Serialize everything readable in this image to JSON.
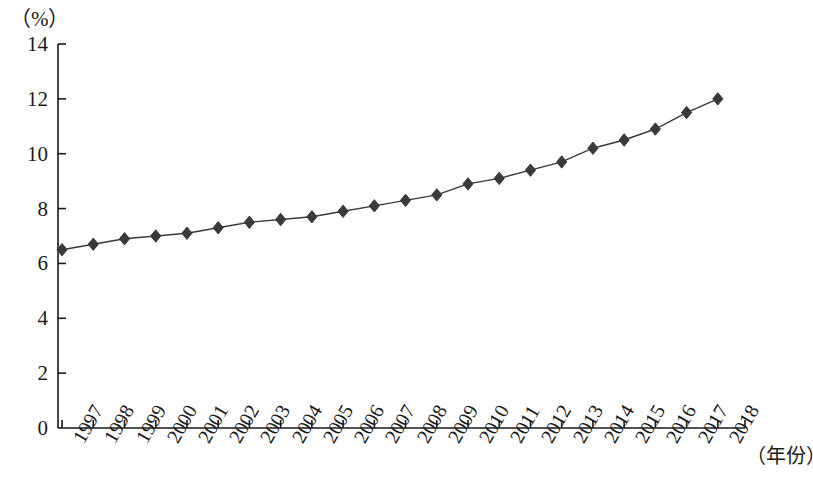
{
  "chart_data": {
    "type": "line",
    "title": "",
    "subtitle": "",
    "ylabel": "（%）",
    "xlabel": "（年份）",
    "ylim": [
      0,
      14
    ],
    "ytick_values": [
      0,
      2,
      4,
      6,
      8,
      10,
      12,
      14
    ],
    "ytick_labels": [
      "0",
      "2",
      "4",
      "6",
      "8",
      "10",
      "12",
      "14"
    ],
    "grid": false,
    "legend": null,
    "marker": "diamond",
    "line_color": "#3a3a3a",
    "marker_color": "#3a3a3a",
    "axis_color": "#1a1a1a",
    "categories": [
      "1997",
      "1998",
      "1999",
      "2000",
      "2001",
      "2002",
      "2003",
      "2004",
      "2005",
      "2006",
      "2007",
      "2008",
      "2009",
      "2010",
      "2011",
      "2012",
      "2013",
      "2014",
      "2015",
      "2016",
      "2017",
      "2018"
    ],
    "values": [
      6.5,
      6.7,
      6.9,
      7.0,
      7.1,
      7.3,
      7.5,
      7.6,
      7.7,
      7.9,
      8.1,
      8.3,
      8.5,
      8.9,
      9.1,
      9.4,
      9.7,
      10.2,
      10.5,
      10.9,
      11.5,
      12.0
    ],
    "series": [
      {
        "name": "",
        "values": [
          6.5,
          6.7,
          6.9,
          7.0,
          7.1,
          7.3,
          7.5,
          7.6,
          7.7,
          7.9,
          8.1,
          8.3,
          8.5,
          8.9,
          9.1,
          9.4,
          9.7,
          10.2,
          10.5,
          10.9,
          11.5,
          12.0
        ]
      }
    ]
  },
  "layout": {
    "plot_left": 58,
    "plot_right": 745,
    "plot_top": 44,
    "plot_bottom": 428
  }
}
